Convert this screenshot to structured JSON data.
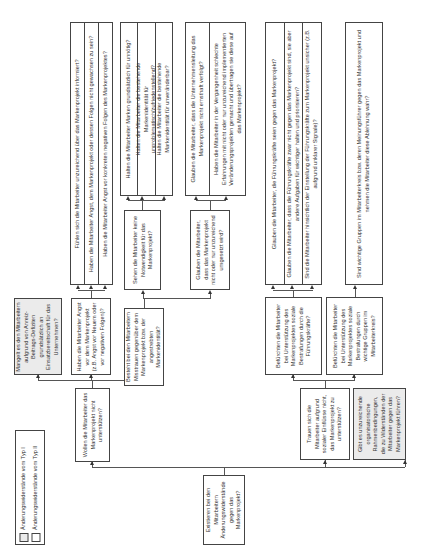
{
  "legend": {
    "items": [
      {
        "label": "Änderungswiderstände vom Typ I",
        "fill": "#ebebeb"
      },
      {
        "label": "Änderungswiderstände vom Typ II",
        "fill": "#ffffff"
      }
    ]
  },
  "root": "Existieren bei den Mitarbeitern Änderungswiderstände gegen das Markenprojekt?",
  "level1": {
    "wollen": "Wollen die Mitarbeiter das Markenprojekt nicht unterstützen?",
    "trauen": "Trauen sich die Mitarbeiter aufgrund sozialer Einflüsse nicht, das Markenprojekt zu unterstützen?",
    "gibt_es": "Gibt es unzureichende organisatorische Rahmenbedingungen, die zu Widerständen der Mitarbeiter gegen das Markenprojekt führen?"
  },
  "level2": {
    "mangelt": "Mangelt es den Mitarbeitern aufgrund von Anreiz-Beitrags-Defiziten grundsätzlich an Einsatzbereitschaft für das Unternehmen?",
    "angst": "Haben die Mitarbeiter Angst vor dem Markenprojekt (z.B. Angst vor Neuem oder vor negativen Folgen)?",
    "besteht": "Besteht bei den Mitarbeitern Misstrauen gegenüber dem Markenprojekt bzw. der angestrebten Markenidentität?",
    "befuerchten_fk": "Befürchten die Mitarbeiter bei Unterstützung des Markenprojektes soziale Bestrafungen durch die Führungskräfte?",
    "befuerchten_gr": "Befürchten die Mitarbeiter bei Unterstützung des Markenprojektes soziale Bestrafungen durch wichtige Gruppen im Mitarbeiterkreis?"
  },
  "level3": {
    "sehen": "Sehen die Mitarbeiter keine Notwendigkeit für das Markenprojekt?",
    "glauben": "Glauben die Mitarbeiter, dass das Markenprojekt nicht oder nur unzureichend umgesetzt wird?"
  },
  "leaves": {
    "angst_group": [
      "Fühlen sich die Mitarbeiter unzureichend über das Markenprojekt informiert?",
      "Haben die Mitarbeiter Angst, dem Markenprojekt oder dessen Folgen nicht gewachsen zu sein?",
      "Haben die Mitarbeiter Angst vor konkreten negativen Folgen des Markenprojektes?"
    ],
    "sehen_group": [
      "Halten die Mitarbeiter Marken grundsätzlich für unnötig?",
      "Halten die Mitarbeiter die bestehende Markenidentität für unproblematisch/zufriedenstellend?",
      "Halten die Mitarbeiter die bestehende Markenidentität für unveränderbar?"
    ],
    "glauben_group": [
      "Glauben die Mitarbeiter, dass die Unternehmensleitung das Markenprojekt nicht ernsthaft verfolgt?",
      "Haben die Mitarbeiter in der Vergangenheit schlechte Erfahrungen mit nicht oder nur unzureichend implementierten Veränderungsprojekten gemacht und übertragen sie diese auf das Markenprojekt?"
    ],
    "fk_group": [
      "Glauben die Mitarbeiter, die Führungskräfte seien gegen das Markenprojekt?",
      "Glauben die Mitarbeiter, dass die Führungskräfte zwar nicht gegen das Markenprojekt sind, sie aber andere Aufgaben für wichtiger halten und priorisieren?",
      "Sind die Mitarbeiter hinsichtlich der Einstellung der Führungskräfte zum Markenprojekt unsicher (z.B. aufgrund unklarer Signale)?"
    ],
    "gr_group": [
      "Sind wichtige Gruppen im Mitarbeiterkreis bzw. deren Meinungsführer gegen das Markenprojekt und nehmen die Mitarbeiter diese Ablehnung wahr?"
    ]
  }
}
